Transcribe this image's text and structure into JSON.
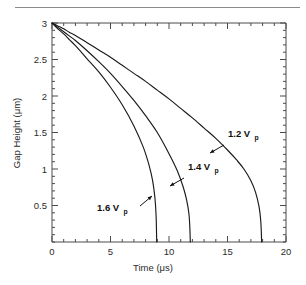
{
  "figure": {
    "background_color": "#ffffff",
    "axis_color": "#4a4a4a",
    "curve_color": "#1a1a1a",
    "rule_color": "#8a8a8a",
    "text_color": "#2b2b2b"
  },
  "chart_data": {
    "type": "line",
    "title": "",
    "subtitle": "",
    "xlabel": "Time (μs)",
    "ylabel": "Gap Height (μm)",
    "xlim": [
      0,
      20
    ],
    "ylim": [
      0,
      3
    ],
    "grid": false,
    "legend_position": "inline-annotations",
    "x_ticks": [
      0,
      5,
      10,
      15,
      20
    ],
    "x_tick_labels": [
      "0",
      "5",
      "10",
      "15",
      "20"
    ],
    "x_minor_tick_step": 1,
    "y_ticks": [
      0.5,
      1,
      1.5,
      2,
      2.5,
      3
    ],
    "y_tick_labels": [
      "0.5",
      "1",
      "1.5",
      "2",
      "2.5",
      "3"
    ],
    "y_minor_tick_step": 0.1,
    "series": [
      {
        "name": "1.2 Vp",
        "label_text": "1.2 V",
        "label_sub": "p",
        "x": [
          0,
          0.5,
          1,
          1.5,
          2,
          3,
          4,
          5,
          6,
          7,
          8,
          9,
          10,
          11,
          12,
          13,
          14,
          15,
          15.8,
          16.4,
          17,
          17.4,
          17.7,
          17.85,
          17.92
        ],
        "y": [
          3,
          2.96,
          2.92,
          2.87,
          2.83,
          2.73,
          2.63,
          2.53,
          2.42,
          2.31,
          2.2,
          2.08,
          1.96,
          1.83,
          1.7,
          1.56,
          1.42,
          1.26,
          1.12,
          1.0,
          0.84,
          0.68,
          0.48,
          0.27,
          0.0
        ]
      },
      {
        "name": "1.4 Vp",
        "label_text": "1.4 V",
        "label_sub": "p",
        "x": [
          0,
          0.5,
          1,
          1.5,
          2,
          3,
          4,
          5,
          6,
          7,
          8,
          9,
          10,
          10.7,
          11.2,
          11.5,
          11.7,
          11.78,
          11.82
        ],
        "y": [
          3,
          2.94,
          2.88,
          2.82,
          2.76,
          2.62,
          2.47,
          2.31,
          2.13,
          1.94,
          1.73,
          1.5,
          1.21,
          0.98,
          0.76,
          0.58,
          0.39,
          0.2,
          0.0
        ]
      },
      {
        "name": "1.6 Vp",
        "label_text": "1.6 V",
        "label_sub": "p",
        "x": [
          0,
          0.5,
          1,
          1.5,
          2,
          2.5,
          3,
          4,
          5,
          6,
          7,
          7.8,
          8.3,
          8.6,
          8.8,
          8.9,
          8.95
        ],
        "y": [
          3,
          2.92,
          2.85,
          2.77,
          2.69,
          2.6,
          2.51,
          2.33,
          2.12,
          1.88,
          1.59,
          1.3,
          1.05,
          0.84,
          0.6,
          0.35,
          0.0
        ]
      }
    ],
    "annotations": [
      {
        "text": "1.2 V",
        "sub": "p",
        "label_x_px": 228,
        "label_y_px": 137,
        "arrow_from_px": [
          224,
          145
        ],
        "arrow_to_px": [
          210,
          153
        ]
      },
      {
        "text": "1.4 V",
        "sub": "p",
        "label_x_px": 188,
        "label_y_px": 170,
        "arrow_from_px": [
          184,
          178
        ],
        "arrow_to_px": [
          170,
          186
        ]
      },
      {
        "text": "1.6 V",
        "sub": "p",
        "label_x_px": 97,
        "label_y_px": 211,
        "arrow_from_px": [
          140,
          206
        ],
        "arrow_to_px": [
          152,
          196
        ]
      }
    ]
  }
}
